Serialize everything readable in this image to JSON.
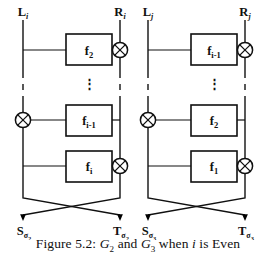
{
  "figure": {
    "caption_prefix": "Figure 5.2:",
    "caption_g2": "G",
    "caption_g2_sub": "2",
    "caption_and": "and",
    "caption_g3": "G",
    "caption_g3_sub": "3",
    "caption_when": "when",
    "caption_i": "i",
    "caption_tail": "is Even",
    "caption_full": "Figure 5.2: G2 and G3 when i is Even",
    "ink_color": "#101010",
    "background_color": "#ffffff"
  },
  "diagrams": [
    {
      "name": "G2",
      "input_left": {
        "base": "L",
        "sub": "i"
      },
      "input_right": {
        "base": "R",
        "sub": "i"
      },
      "output_left": {
        "base": "S",
        "sub": "σ",
        "subsub": "2"
      },
      "output_right": {
        "base": "T",
        "sub": "σ",
        "subsub": "2"
      },
      "rounds": [
        {
          "box_base": "f",
          "box_sub": "2",
          "xor_side": "right"
        },
        {
          "box_base": "⋮",
          "box_sub": "",
          "xor_side": "none"
        },
        {
          "box_base": "f",
          "box_sub": "i-1",
          "xor_side": "left"
        },
        {
          "box_base": "f",
          "box_sub": "i",
          "xor_side": "right"
        }
      ]
    },
    {
      "name": "G3",
      "input_left": {
        "base": "L",
        "sub": "j"
      },
      "input_right": {
        "base": "R",
        "sub": "j"
      },
      "output_left": {
        "base": "S",
        "sub": "σ",
        "subsub": "3"
      },
      "output_right": {
        "base": "T",
        "sub": "σ",
        "subsub": "3"
      },
      "rounds": [
        {
          "box_base": "f",
          "box_sub": "i-1",
          "xor_side": "right"
        },
        {
          "box_base": "⋮",
          "box_sub": "",
          "xor_side": "none"
        },
        {
          "box_base": "f",
          "box_sub": "2",
          "xor_side": "left"
        },
        {
          "box_base": "f",
          "box_sub": "1",
          "xor_side": "right"
        }
      ]
    }
  ]
}
